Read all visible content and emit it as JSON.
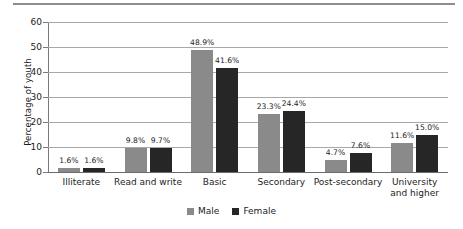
{
  "chart_data": {
    "type": "bar",
    "title": "",
    "xlabel": "",
    "ylabel": "Percentage of youth",
    "ylim": [
      0,
      60
    ],
    "yticks": [
      "0",
      "10",
      "20",
      "30",
      "40",
      "50",
      "60"
    ],
    "grid": true,
    "legend_position": "bottom",
    "categories": [
      "Illiterate",
      "Read and write",
      "Basic",
      "Secondary",
      "Post-secondary",
      "University and higher"
    ],
    "category_lines": [
      [
        "Illiterate"
      ],
      [
        "Read and write"
      ],
      [
        "Basic"
      ],
      [
        "Secondary"
      ],
      [
        "Post-secondary"
      ],
      [
        "University",
        "and higher"
      ]
    ],
    "series": [
      {
        "name": "Male",
        "color": "#8a8a8a",
        "values": [
          1.6,
          9.8,
          48.9,
          23.3,
          4.7,
          11.6
        ],
        "labels": [
          "1.6%",
          "9.8%",
          "48.9%",
          "23.3%",
          "4.7%",
          "11.6%"
        ]
      },
      {
        "name": "Female",
        "color": "#262626",
        "values": [
          1.6,
          9.7,
          41.6,
          24.4,
          7.6,
          15.0
        ],
        "labels": [
          "1.6%",
          "9.7%",
          "41.6%",
          "24.4%",
          "7.6%",
          "15.0%"
        ]
      }
    ]
  },
  "legend": {
    "items": [
      {
        "label": "Male"
      },
      {
        "label": "Female"
      }
    ]
  }
}
